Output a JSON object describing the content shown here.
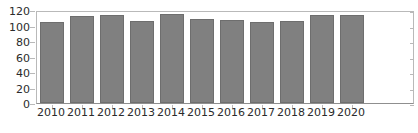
{
  "chart_data": {
    "type": "bar",
    "title": "",
    "subtitle": "",
    "xlabel": "",
    "ylabel": "",
    "categories": [
      "2010",
      "2011",
      "2012",
      "2013",
      "2014",
      "2015",
      "2016",
      "2017",
      "2018",
      "2019",
      "2020"
    ],
    "values": [
      105,
      112,
      113,
      106,
      115,
      108,
      107,
      104,
      106,
      113,
      113
    ],
    "series": [
      {
        "name": "",
        "values": [
          105,
          112,
          113,
          106,
          115,
          108,
          107,
          104,
          106,
          113,
          113
        ]
      }
    ],
    "ylim": [
      0,
      120
    ],
    "yticks": [
      0,
      20,
      40,
      60,
      80,
      100,
      120
    ],
    "ytick_labels": [
      "0",
      "20",
      "40",
      "60",
      "80",
      "100",
      "120"
    ],
    "grid": false,
    "legend": false,
    "legend_position": "none",
    "bar_color": "#808080",
    "bar_edge_color": "#6e6e6e",
    "axis_color": "#b9b9b9",
    "text_color": "#2b2b2b",
    "background_color": "#ffffff",
    "annotations": []
  }
}
